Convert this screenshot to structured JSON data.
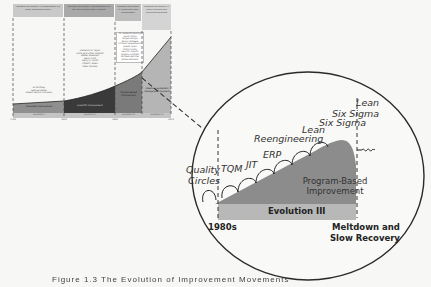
{
  "mini_chart": {
    "headers": [
      {
        "text": "Industrial Revolution I: Mechanization via Water and Steam Power"
      },
      {
        "text": "Industrial Revolution II: Electrification via the Grid and Scientific Methods"
      },
      {
        "text": "Industrial Revolution III: Technology and Globalization"
      },
      {
        "text": "Industrial Revolution IV: Cyber Physical and Connected Systems"
      }
    ],
    "people": [
      {
        "text": "Eli Whitney\nSamuel Slater\nRobert Dennis Company"
      },
      {
        "text": "Frederick W. Taylor\nFrank and Lillian Gilbreth\nWalter Shewhart\nHenry Ford\nHenry L. Gantt\nAlfred P. Sloan\nPeter Drucker"
      },
      {
        "text": "W. Edwards Deming\nTaiichi Ohno\nShigeo Shingo\nKaoru Ishikawa\nArmand Feigenbaum\nJoseph Juran\nPhilip Crosby\nGenichi Taguchi\nEliyahu Goldratt\nMichael Hammer\nJames Womack"
      },
      {
        "text": ""
      }
    ],
    "areas": [
      {
        "label": "Piecemeal Improvement",
        "color": "#8f8f8f"
      },
      {
        "label": "Scientific Improvement",
        "color": "#3a3a3a"
      },
      {
        "label": "Program-Based Improvement",
        "color": "#7a7a7a"
      },
      {
        "label": "Adaptive, Systematic Management Approach",
        "color": "#b5b5b5"
      }
    ],
    "evolutions": [
      "Evolution I",
      "Evolution II",
      "Evolution III",
      "Evolution IV"
    ],
    "years": [
      "1780",
      "1900",
      "1980",
      "2010"
    ]
  },
  "magnified": {
    "programs": [
      {
        "label": "Quality\nCircles"
      },
      {
        "label": "TQM"
      },
      {
        "label": "JIT"
      },
      {
        "label": "ERP"
      },
      {
        "label": "Reengineering"
      },
      {
        "label": "Lean"
      },
      {
        "label": "Six Sigma"
      },
      {
        "label": "Lean\nSix Sigma"
      }
    ],
    "area_label": "Program-Based\nImprovement",
    "evolution_label": "Evolution III",
    "start_label": "1980s",
    "end_label": "Meltdown and\nSlow Recovery"
  },
  "caption": "Figure 1.3   The Evolution of Improvement Movements"
}
